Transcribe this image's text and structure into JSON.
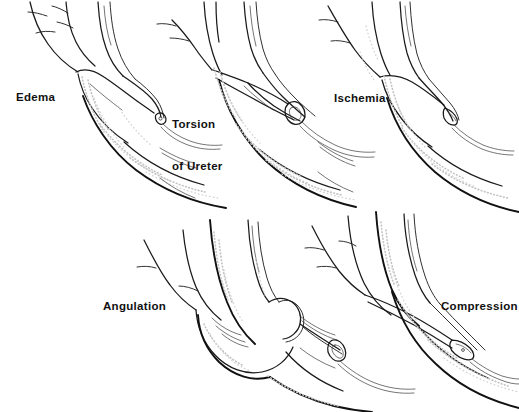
{
  "figure": {
    "style": "pen-and-ink medical line drawing with stipple shading",
    "width": 519,
    "height": 412,
    "background_color": "#ffffff",
    "ink_color": "#1a1a1a",
    "stipple_color": "#bdbdbd"
  },
  "panels": [
    {
      "id": "edema",
      "label": "Edema",
      "row": "top",
      "column": 1,
      "label_lines": [
        "Edema"
      ]
    },
    {
      "id": "torsion",
      "label": "Torsion of Ureter",
      "row": "top",
      "column": 2,
      "label_lines": [
        "Torsion",
        "of Ureter"
      ],
      "label_line_1": "Torsion",
      "label_line_2": "of Ureter"
    },
    {
      "id": "ischemia",
      "label": "Ischemia",
      "row": "top",
      "column": 3,
      "label_lines": [
        "Ischemia"
      ]
    },
    {
      "id": "angulation",
      "label": "Angulation",
      "row": "bottom",
      "column": 1,
      "label_lines": [
        "Angulation"
      ]
    },
    {
      "id": "compression",
      "label": "Compression",
      "row": "bottom",
      "column": 2,
      "label_lines": [
        "Compression"
      ]
    }
  ]
}
